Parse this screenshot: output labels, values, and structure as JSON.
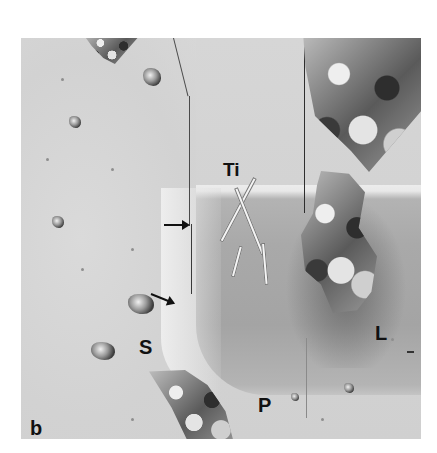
{
  "figure": {
    "panel_label": "b",
    "type": "scanning electron micrograph",
    "colormode": "grayscale"
  },
  "labels": {
    "ti": "Ti",
    "s": "S",
    "l": "L",
    "p": "P",
    "b": "b"
  },
  "annotations": {
    "arrows": [
      {
        "direction": "right",
        "x": 163,
        "y": 224
      },
      {
        "direction": "down-right",
        "x": 150,
        "y": 292
      }
    ],
    "scale_bar": {
      "visible": true,
      "label": ""
    }
  },
  "colors": {
    "background": "#ffffff",
    "substrate_light": "#d6d6d6",
    "substrate_dark": "#a6a6a6",
    "label": "#111111"
  }
}
